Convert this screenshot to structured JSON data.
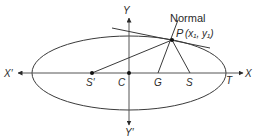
{
  "figure": {
    "type": "ellipse-normal-diagram",
    "labels": {
      "normal": "Normal",
      "point_p": "P",
      "point_p_coords": "(x₁, y₁)",
      "x_axis_pos": "X",
      "x_axis_neg": "X′",
      "y_axis_pos": "Y",
      "y_axis_neg": "Y′",
      "center": "C",
      "focus_left": "S′",
      "focus_right": "S",
      "normal_foot": "G",
      "tangent_foot": "T"
    },
    "colors": {
      "stroke": "#3a3a3a",
      "text": "#2a2a2a",
      "background": "#ffffff"
    }
  }
}
